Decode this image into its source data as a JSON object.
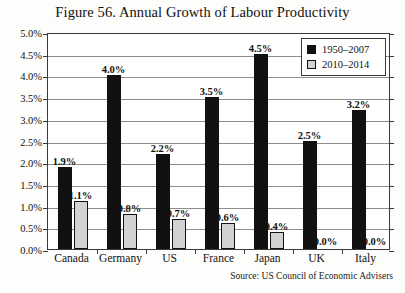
{
  "figure": {
    "title": "Figure 56. Annual Growth of Labour Productivity",
    "source": "Source: US Council of Economic Advisers"
  },
  "chart_data": {
    "type": "bar",
    "title": "Figure 56. Annual Growth of Labour Productivity",
    "xlabel": "",
    "ylabel": "",
    "ylim": [
      0,
      5
    ],
    "ytick_step": 0.5,
    "yticks": [
      "0.0%",
      "0.5%",
      "1.0%",
      "1.5%",
      "2.0%",
      "2.5%",
      "3.0%",
      "3.5%",
      "4.0%",
      "4.5%",
      "5.0%"
    ],
    "ytick_values": [
      0,
      0.5,
      1,
      1.5,
      2,
      2.5,
      3,
      3.5,
      4,
      4.5,
      5
    ],
    "grid": true,
    "legend_position": "top-right",
    "categories": [
      "Canada",
      "Germany",
      "US",
      "France",
      "Japan",
      "UK",
      "Italy"
    ],
    "series": [
      {
        "name": "1950–2007",
        "color": "#111111",
        "values": [
          1.9,
          4.0,
          2.2,
          3.5,
          4.5,
          2.5,
          3.2
        ],
        "labels": [
          "1.9%",
          "4.0%",
          "2.2%",
          "3.5%",
          "4.5%",
          "2.5%",
          "3.2%"
        ]
      },
      {
        "name": "2010–2014",
        "color": "#d2d2d2",
        "values": [
          1.1,
          0.8,
          0.7,
          0.6,
          0.4,
          0.0,
          0.0
        ],
        "labels": [
          "1.1%",
          "0.8%",
          "0.7%",
          "0.6%",
          "0.4%",
          "0.0%",
          "0.0%"
        ]
      }
    ],
    "annotations": [
      "Source: US Council of Economic Advisers"
    ]
  }
}
